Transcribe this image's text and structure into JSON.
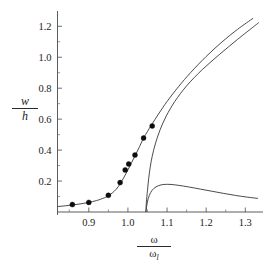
{
  "chart_data": {
    "type": "line",
    "title": "",
    "subtitle": "",
    "xlabel": "ω/ω_l",
    "ylabel": "w/h",
    "xlabel_parts": {
      "numerator": "ω",
      "denominator": "ω",
      "denominator_sub": "l"
    },
    "ylabel_parts": {
      "numerator": "w",
      "denominator": "h"
    },
    "xlim": [
      0.82,
      1.335
    ],
    "ylim": [
      0.0,
      1.26
    ],
    "xticks": [
      0.9,
      1.0,
      1.1,
      1.2,
      1.3
    ],
    "xtick_labels": [
      "0.9",
      "1.0",
      "1.1",
      "1.2",
      "1.3"
    ],
    "yticks": [
      0.2,
      0.4,
      0.6,
      0.8,
      1.0,
      1.2
    ],
    "ytick_labels": [
      "0.2",
      "0.4",
      "0.6",
      "0.8",
      "1.0",
      "1.2"
    ],
    "x_minor_ticks": [
      0.85,
      0.95,
      1.05,
      1.15,
      1.25
    ],
    "y_minor_ticks": [
      0.1,
      0.3,
      0.5,
      0.7,
      0.9,
      1.1
    ],
    "grid": false,
    "legend": "none",
    "series": [
      {
        "name": "upper-branch-curve",
        "type": "line",
        "points": [
          [
            0.82,
            0.035
          ],
          [
            0.84,
            0.04
          ],
          [
            0.86,
            0.046
          ],
          [
            0.88,
            0.053
          ],
          [
            0.9,
            0.062
          ],
          [
            0.92,
            0.074
          ],
          [
            0.94,
            0.092
          ],
          [
            0.95,
            0.105
          ],
          [
            0.96,
            0.123
          ],
          [
            0.97,
            0.147
          ],
          [
            0.98,
            0.181
          ],
          [
            0.99,
            0.225
          ],
          [
            1.0,
            0.272
          ],
          [
            1.01,
            0.322
          ],
          [
            1.02,
            0.372
          ],
          [
            1.03,
            0.424
          ],
          [
            1.04,
            0.478
          ],
          [
            1.05,
            0.52
          ],
          [
            1.06,
            0.562
          ],
          [
            1.08,
            0.64
          ],
          [
            1.1,
            0.714
          ],
          [
            1.13,
            0.812
          ],
          [
            1.16,
            0.9
          ],
          [
            1.2,
            1.005
          ],
          [
            1.24,
            1.098
          ],
          [
            1.28,
            1.18
          ],
          [
            1.32,
            1.252
          ]
        ]
      },
      {
        "name": "backbone-curve",
        "type": "line",
        "points": [
          [
            1.046,
            0.0
          ],
          [
            1.047,
            0.06
          ],
          [
            1.05,
            0.14
          ],
          [
            1.053,
            0.215
          ],
          [
            1.057,
            0.29
          ],
          [
            1.062,
            0.36
          ],
          [
            1.07,
            0.44
          ],
          [
            1.082,
            0.53
          ],
          [
            1.098,
            0.62
          ],
          [
            1.12,
            0.715
          ],
          [
            1.15,
            0.815
          ],
          [
            1.19,
            0.92
          ],
          [
            1.235,
            1.02
          ],
          [
            1.28,
            1.115
          ],
          [
            1.325,
            1.205
          ],
          [
            1.335,
            1.225
          ]
        ]
      },
      {
        "name": "lower-branch-curve",
        "type": "line",
        "points": [
          [
            1.046,
            0.0
          ],
          [
            1.048,
            0.04
          ],
          [
            1.052,
            0.088
          ],
          [
            1.058,
            0.125
          ],
          [
            1.066,
            0.152
          ],
          [
            1.078,
            0.17
          ],
          [
            1.092,
            0.178
          ],
          [
            1.11,
            0.178
          ],
          [
            1.13,
            0.172
          ],
          [
            1.155,
            0.162
          ],
          [
            1.185,
            0.148
          ],
          [
            1.215,
            0.134
          ],
          [
            1.245,
            0.12
          ],
          [
            1.275,
            0.107
          ],
          [
            1.305,
            0.096
          ],
          [
            1.332,
            0.088
          ]
        ]
      }
    ],
    "data_points": {
      "name": "measured-data-points",
      "marker": "filled-circle",
      "x": [
        0.858,
        0.9,
        0.95,
        0.98,
        0.993,
        1.002,
        1.018,
        1.04,
        1.062
      ],
      "y": [
        0.048,
        0.062,
        0.108,
        0.19,
        0.272,
        0.31,
        0.368,
        0.478,
        0.556
      ]
    }
  },
  "colors": {
    "curve": "#2a2a2a",
    "marker": "#0d0d0d",
    "axis": "#4a4a4a",
    "background": "#ffffff"
  }
}
